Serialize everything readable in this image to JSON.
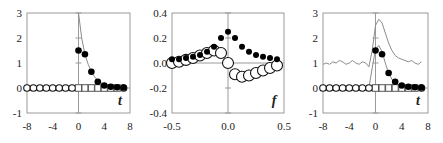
{
  "chart_data": [
    {
      "type": "scatter",
      "panel": "left",
      "xlabel": "t",
      "xlim": [
        -8,
        8
      ],
      "ylim": [
        -1,
        3
      ],
      "xticks": [
        "-8",
        "-4",
        "0",
        "4",
        "8"
      ],
      "yticks": [
        "3",
        "2",
        "1",
        "0",
        "-1"
      ],
      "series": [
        {
          "name": "open-circles",
          "marker": "open-circle",
          "x": [
            -8,
            -7,
            -6,
            -5,
            -4,
            -3,
            -2,
            -1,
            7
          ],
          "y": [
            0,
            0,
            0,
            0,
            0,
            0,
            0,
            0,
            0
          ]
        },
        {
          "name": "open-squares",
          "marker": "open-square",
          "x": [
            0,
            1,
            2,
            3,
            4,
            5,
            6
          ],
          "y": [
            0,
            0,
            0,
            0,
            0,
            0,
            0
          ]
        },
        {
          "name": "filled-dots",
          "marker": "filled-circle",
          "x": [
            0,
            1,
            2,
            3,
            4,
            5,
            6,
            7
          ],
          "y": [
            1.5,
            1.35,
            0.65,
            0.25,
            0.1,
            0.05,
            0.03,
            0.02
          ]
        },
        {
          "name": "decay-curve",
          "marker": "line",
          "x": [
            0,
            0.5,
            1,
            1.5,
            2,
            2.5,
            3,
            4,
            5,
            6,
            7
          ],
          "y": [
            3.0,
            2.0,
            1.35,
            0.95,
            0.65,
            0.45,
            0.3,
            0.13,
            0.06,
            0.03,
            0.02
          ]
        }
      ]
    },
    {
      "type": "scatter",
      "panel": "middle",
      "xlabel": "f",
      "xlim": [
        -0.5,
        0.5
      ],
      "ylim": [
        -0.4,
        0.4
      ],
      "xticks": [
        "-0.5",
        "0.0",
        "0.5"
      ],
      "yticks": [
        "0.4",
        "0.2",
        "0.0",
        "-0.2",
        "-0.4"
      ],
      "series": [
        {
          "name": "filled-dots",
          "marker": "filled-circle",
          "x": [
            -0.5,
            -0.4375,
            -0.375,
            -0.3125,
            -0.25,
            -0.1875,
            -0.125,
            -0.0625,
            0.0,
            0.0625,
            0.125,
            0.1875,
            0.25,
            0.3125,
            0.375,
            0.4375
          ],
          "y": [
            0.03,
            0.03,
            0.04,
            0.05,
            0.065,
            0.09,
            0.13,
            0.2,
            0.25,
            0.2,
            0.13,
            0.09,
            0.065,
            0.05,
            0.04,
            0.03
          ]
        },
        {
          "name": "open-circles",
          "marker": "open-circle",
          "x": [
            -0.5,
            -0.4375,
            -0.375,
            -0.3125,
            -0.25,
            -0.1875,
            -0.125,
            -0.0625,
            0.0,
            0.0625,
            0.125,
            0.1875,
            0.25,
            0.3125,
            0.375,
            0.4375
          ],
          "y": [
            0.0,
            0.01,
            0.025,
            0.04,
            0.06,
            0.08,
            0.1,
            0.08,
            0.0,
            -0.09,
            -0.11,
            -0.1,
            -0.08,
            -0.06,
            -0.04,
            -0.02
          ]
        }
      ]
    },
    {
      "type": "scatter",
      "panel": "right",
      "xlabel": "t",
      "xlim": [
        -8,
        8
      ],
      "ylim": [
        -1,
        3
      ],
      "xticks": [
        "-8",
        "-4",
        "0",
        "4",
        "8"
      ],
      "yticks": [
        "3",
        "2",
        "1",
        "0",
        "-1"
      ],
      "series": [
        {
          "name": "open-circles",
          "marker": "open-circle",
          "x": [
            -8,
            -7,
            -6,
            -5,
            -4,
            -3,
            -2,
            -1,
            7
          ],
          "y": [
            0,
            0,
            0,
            0,
            0,
            0,
            0,
            0,
            0
          ]
        },
        {
          "name": "open-squares",
          "marker": "open-square",
          "x": [
            0,
            1,
            2,
            3,
            4,
            5,
            6
          ],
          "y": [
            0,
            0,
            0,
            0,
            0,
            0,
            0
          ]
        },
        {
          "name": "filled-dots",
          "marker": "filled-circle",
          "x": [
            0,
            1,
            2,
            3,
            4,
            5,
            6,
            7
          ],
          "y": [
            1.5,
            1.35,
            0.6,
            0.25,
            0.1,
            0.05,
            0.03,
            0.02
          ]
        },
        {
          "name": "upper-envelope",
          "marker": "line",
          "x": [
            -8,
            -7.5,
            -7,
            -6.5,
            -6,
            -5.5,
            -5,
            -4.5,
            -4,
            -3.5,
            -3,
            -2.5,
            -2,
            -1.5,
            -1,
            -0.5,
            0,
            0.5,
            1,
            1.5,
            2,
            2.5,
            3,
            3.5,
            4,
            4.5,
            5,
            5.5,
            6,
            6.5,
            7
          ],
          "y": [
            0.95,
            1.0,
            0.95,
            1.05,
            1.0,
            1.1,
            1.05,
            0.95,
            1.0,
            1.1,
            1.0,
            0.95,
            1.05,
            1.0,
            0.85,
            1.5,
            2.5,
            2.75,
            2.6,
            2.2,
            1.8,
            1.5,
            1.3,
            1.2,
            1.15,
            1.1,
            1.05,
            1.1,
            1.0,
            0.95,
            1.05
          ]
        },
        {
          "name": "inner-pulse",
          "marker": "line",
          "x": [
            -1,
            -0.5,
            0,
            0.5,
            1,
            1.5,
            2,
            2.5,
            3,
            4,
            5,
            6,
            7
          ],
          "y": [
            0.0,
            0.8,
            1.55,
            1.7,
            1.45,
            1.0,
            0.6,
            0.35,
            0.2,
            0.08,
            0.04,
            0.02,
            0.01
          ]
        }
      ]
    }
  ],
  "panels": [
    {
      "x_axis_label": "t"
    },
    {
      "x_axis_label": "f"
    },
    {
      "x_axis_label": "t"
    }
  ]
}
